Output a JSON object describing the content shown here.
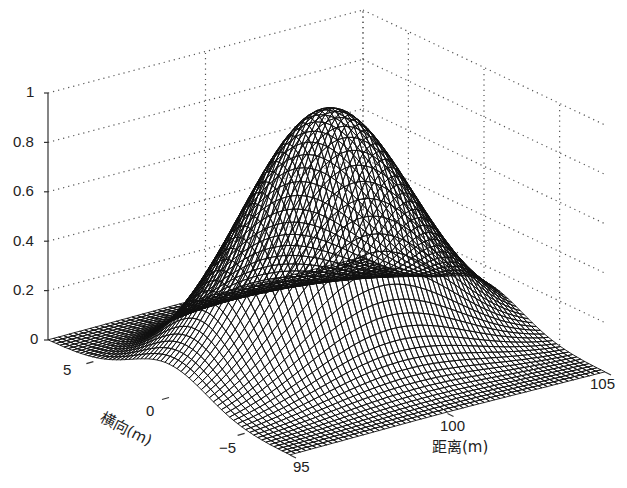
{
  "chart_data": {
    "type": "surface3d",
    "title": "",
    "function": "z = exp(-((x-100)^2 + y^2) / (2*sigma^2))",
    "sigma": 2.5,
    "xlabel": "距离(m)",
    "ylabel": "横向(m)",
    "zlabel": "",
    "xlim": [
      95,
      105
    ],
    "ylim": [
      -8,
      8
    ],
    "zlim": [
      0,
      1
    ],
    "x_ticks": [
      95,
      100,
      105
    ],
    "y_ticks": [
      -5,
      0,
      5
    ],
    "z_ticks": [
      0,
      0.2,
      0.4,
      0.6,
      0.8,
      1
    ],
    "x_tick_labels": [
      "95",
      "100",
      "105"
    ],
    "y_tick_labels": [
      "-5",
      "0",
      "5"
    ],
    "z_tick_labels": [
      "0",
      "0.2",
      "0.4",
      "0.6",
      "0.8",
      "1"
    ],
    "peak": {
      "x": 100,
      "y": 0,
      "z": 1
    },
    "grid": true,
    "grid_style": "dotted",
    "mesh_resolution": 61,
    "colormap": "grayscale wireframe"
  },
  "labels": {
    "z_ticks": [
      "1",
      "0.8",
      "0.6",
      "0.4",
      "0.2",
      "0"
    ],
    "y_ticks": [
      "5",
      "0",
      "−5"
    ],
    "x_ticks": [
      "95",
      "100",
      "105"
    ],
    "xlabel": "距离(m)",
    "ylabel": "横向(m)"
  }
}
